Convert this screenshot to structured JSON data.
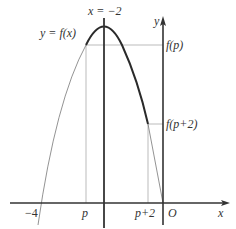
{
  "diagram": {
    "type": "function-graph",
    "labels": {
      "axis_of_symmetry": "x = −2",
      "function": "y = f(x)",
      "y_axis": "y",
      "x_axis": "x",
      "origin": "O",
      "x_intercept": "−4",
      "p": "p",
      "p_plus_2": "p+2",
      "f_p": "f(p)",
      "f_p_plus_2": "f(p+2)"
    },
    "colors": {
      "axes": "#333333",
      "curve_bold": "#2a2a2a",
      "curve_thin": "#777777",
      "guide_lines": "#aaaaaa"
    }
  }
}
